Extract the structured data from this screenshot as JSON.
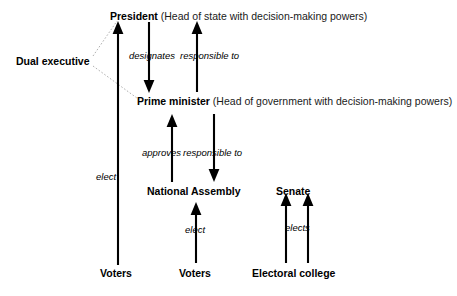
{
  "diagram": {
    "background_color": "#ffffff",
    "arrow_color": "#000000",
    "leader_color": "#b0b0b0",
    "groups": [
      {
        "id": "dual-executive",
        "label": "Dual executive"
      }
    ],
    "nodes": [
      {
        "id": "president",
        "label": "President",
        "description": " (Head of state with decision-making powers)"
      },
      {
        "id": "prime-minister",
        "label": "Prime minister",
        "description": " (Head of government with decision-making powers)"
      },
      {
        "id": "national-assembly",
        "label": "National Assembly",
        "description": ""
      },
      {
        "id": "senate",
        "label": "Senate",
        "description": ""
      },
      {
        "id": "voters-president",
        "label": "Voters",
        "description": ""
      },
      {
        "id": "voters-assembly",
        "label": "Voters",
        "description": ""
      },
      {
        "id": "electoral-college",
        "label": "Electoral college",
        "description": ""
      }
    ],
    "edges": [
      {
        "id": "president-designates-pm",
        "label": "designates",
        "from": "president",
        "to": "prime-minister",
        "direction": "down"
      },
      {
        "id": "pm-responsible-to-president",
        "label": "responsible to",
        "from": "prime-minister",
        "to": "president",
        "direction": "up"
      },
      {
        "id": "assembly-approves-pm",
        "label": "approves",
        "from": "national-assembly",
        "to": "prime-minister",
        "direction": "up"
      },
      {
        "id": "pm-responsible-to-assembly",
        "label": "responsible to",
        "from": "prime-minister",
        "to": "national-assembly",
        "direction": "down"
      },
      {
        "id": "voters-elect-president",
        "label": "elect",
        "from": "voters-president",
        "to": "president",
        "direction": "up"
      },
      {
        "id": "voters-elect-assembly",
        "label": "elect",
        "from": "voters-assembly",
        "to": "national-assembly",
        "direction": "up"
      },
      {
        "id": "college-elects-senate",
        "label": "elects",
        "from": "electoral-college",
        "to": "senate",
        "direction": "up"
      }
    ]
  }
}
